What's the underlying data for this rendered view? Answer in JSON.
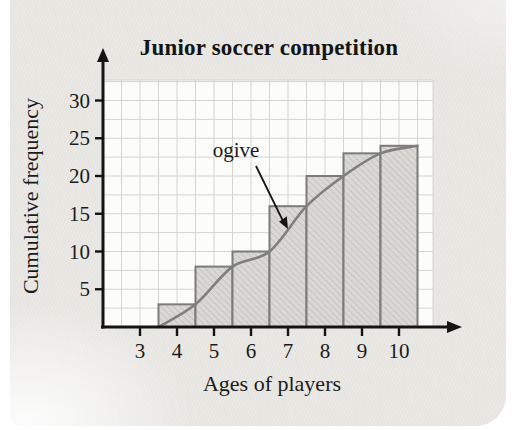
{
  "card": {
    "background": "#e9e8e4"
  },
  "chart_data": {
    "type": "bar",
    "title": "Junior soccer competition",
    "xlabel": "Ages of players",
    "ylabel": "Cumulative frequency",
    "categories": [
      4,
      5,
      6,
      7,
      8,
      9,
      10
    ],
    "values": [
      3,
      8,
      10,
      16,
      20,
      23,
      24
    ],
    "bar_width": 1,
    "ogive": {
      "label": "ogive",
      "points": [
        [
          3.5,
          0
        ],
        [
          4.5,
          3
        ],
        [
          5.5,
          8
        ],
        [
          6.5,
          10
        ],
        [
          7.5,
          16
        ],
        [
          8.5,
          20
        ],
        [
          9.5,
          23
        ],
        [
          10.5,
          24
        ]
      ]
    },
    "x_ticks": [
      "3",
      "4",
      "5",
      "6",
      "7",
      "8",
      "9",
      "10"
    ],
    "x_tick_values": [
      3,
      4,
      5,
      6,
      7,
      8,
      9,
      10
    ],
    "y_ticks": [
      "5",
      "10",
      "15",
      "20",
      "25",
      "30"
    ],
    "y_tick_values": [
      5,
      10,
      15,
      20,
      25,
      30
    ],
    "xlim": [
      2,
      11
    ],
    "ylim": [
      0,
      33
    ],
    "grid": {
      "enabled": true,
      "x_step": 0.5,
      "y_step": 2.5,
      "position": "plot-area-only"
    },
    "legend": {
      "visible": false
    },
    "colors": {
      "bar_fill": "#d9d8d5",
      "bar_hatch": "#bcbbb6",
      "bar_border": "#7b7b79",
      "ogive_line": "#7f7f7d",
      "grid_line": "#d4d4d1",
      "axis": "#141414",
      "plot_bg": "#fcfcfb",
      "text": "#1b1b1b"
    }
  }
}
